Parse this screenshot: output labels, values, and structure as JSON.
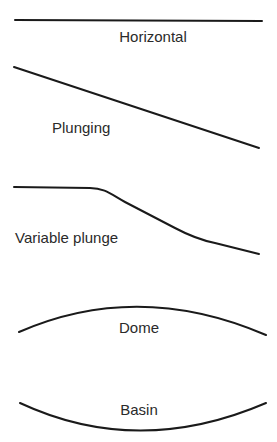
{
  "diagram": {
    "panels": [
      {
        "id": "horizontal",
        "label": "Horizontal"
      },
      {
        "id": "plunging",
        "label": "Plunging"
      },
      {
        "id": "variable-plunge",
        "label": "Variable plunge"
      },
      {
        "id": "dome",
        "label": "Dome"
      },
      {
        "id": "basin",
        "label": "Basin"
      }
    ],
    "colors": {
      "line": "#1a1a1a",
      "text": "#2a2a2a",
      "background": "#ffffff"
    }
  }
}
